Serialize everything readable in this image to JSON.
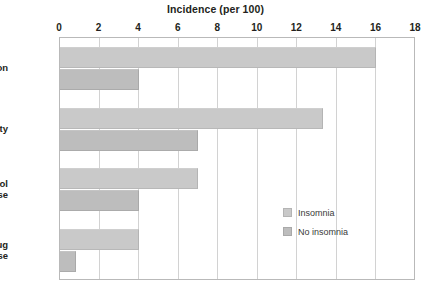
{
  "chart_data": {
    "type": "bar",
    "orientation": "horizontal",
    "title": "Incidence (per 100)",
    "xlabel": "",
    "ylabel": "",
    "xlim": [
      0,
      18
    ],
    "xticks": [
      0,
      2,
      4,
      6,
      8,
      10,
      12,
      14,
      16,
      18
    ],
    "xtick_labels": [
      "0",
      "2",
      "4",
      "6",
      "8",
      "10",
      "12",
      "14",
      "16",
      "18"
    ],
    "grid": "vertical",
    "legend_position": "inside-right",
    "categories": [
      "Depression",
      "Anxiety",
      "Alcohol abuse",
      "Drug abuse"
    ],
    "category_label_lines": [
      [
        "Depression"
      ],
      [
        "Anxiety"
      ],
      [
        "Alcohol",
        "abuse"
      ],
      [
        "Drug",
        "abuse"
      ]
    ],
    "series": [
      {
        "name": "Insomnia",
        "color": "#c9c9c9",
        "values": [
          16.0,
          13.3,
          7.0,
          4.0
        ]
      },
      {
        "name": "No insomnia",
        "color": "#bdbdbd",
        "values": [
          4.0,
          7.0,
          4.0,
          0.8
        ]
      }
    ]
  },
  "legend": {
    "items": [
      {
        "label": "Insomnia",
        "swatch_class": "insomnia"
      },
      {
        "label": "No insomnia",
        "swatch_class": "noinsomnia"
      }
    ]
  },
  "colors": {
    "insomnia": "#c9c9c9",
    "no_insomnia": "#bdbdbd",
    "gridline": "#d2d2d2",
    "frame": "#b9b9b9",
    "text": "#231f20",
    "background": "#ffffff"
  }
}
